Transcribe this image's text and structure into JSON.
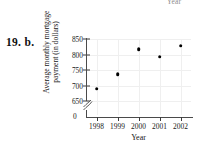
{
  "exercise": {
    "label": "19. b."
  },
  "top_fragment": {
    "text": "Year"
  },
  "chart_data": {
    "type": "scatter",
    "title": "",
    "xlabel": "Year",
    "ylabel": "Average monthly mortgage payment (in dollars)",
    "ylabel_lines": [
      "Average monthly mortgage",
      "payment (in dollars)"
    ],
    "categories": [
      "1998",
      "1999",
      "2000",
      "2001",
      "2002"
    ],
    "x": [
      1998,
      1999,
      2000,
      2001,
      2002
    ],
    "values": [
      690,
      737,
      818,
      793,
      828
    ],
    "ytick_labels": [
      "850",
      "800",
      "750",
      "700",
      "650"
    ],
    "ytick_values": [
      850,
      800,
      750,
      700,
      650
    ],
    "zero_label": "0",
    "ylim": [
      650,
      850
    ],
    "xlim": [
      1997.5,
      2002.5
    ],
    "axis_break": true,
    "grid": true,
    "legend": "none",
    "marker_color": "#000000",
    "axis_color": "#4a4a4a",
    "grid_color": "#efefef"
  }
}
